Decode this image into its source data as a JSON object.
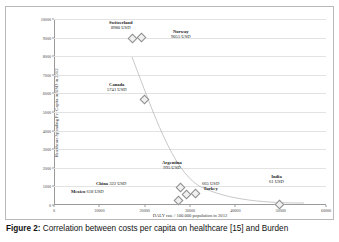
{
  "figure": {
    "caption_lead": "Figure 2:",
    "caption_text": "Correlation between costs per capita on healthcare [15] and Burden"
  },
  "chart_data": {
    "type": "scatter",
    "title": "",
    "xlabel": "DALY rate / 100.000 population in 2012",
    "ylabel": "Healthcare Spending Per Capita in USD in 2012",
    "xlim": [
      0,
      60000
    ],
    "ylim": [
      0,
      10000
    ],
    "xticks": [
      "0",
      "10000",
      "20000",
      "30000",
      "40000",
      "50000",
      "60000"
    ],
    "xtick_values": [
      0,
      10000,
      20000,
      30000,
      40000,
      50000,
      60000
    ],
    "yticks": [
      "0",
      "1000",
      "2000",
      "3000",
      "4000",
      "5000",
      "6000",
      "7000",
      "8000",
      "9000",
      "10000"
    ],
    "ytick_values": [
      0,
      1000,
      2000,
      3000,
      4000,
      5000,
      6000,
      7000,
      8000,
      9000,
      10000
    ],
    "grid": true,
    "legend": "none",
    "marker_color": "#8d8d8d",
    "trendline": true,
    "points": [
      {
        "name": "Switzerland",
        "value_label": "8980 USD",
        "y": 8980,
        "x": 17200
      },
      {
        "name": "Norway",
        "value_label": "9055 USD",
        "y": 9055,
        "x": 19100
      },
      {
        "name": "Canada",
        "value_label": "5741 USD",
        "y": 5741,
        "x": 19800
      },
      {
        "name": "Argentina",
        "value_label": "995 USD",
        "y": 995,
        "x": 27600
      },
      {
        "name": "China",
        "value_label": "322 USD",
        "y": 322,
        "x": 27300
      },
      {
        "name": "Mexico",
        "value_label": "618 USD",
        "y": 618,
        "x": 28900
      },
      {
        "name": "Turkey",
        "value_label": "665 USD",
        "y": 665,
        "x": 30900
      },
      {
        "name": "India",
        "value_label": "61 USD",
        "y": 61,
        "x": 49500
      }
    ]
  }
}
